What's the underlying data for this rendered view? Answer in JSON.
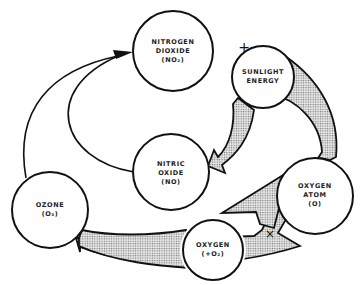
{
  "diagram": {
    "nodes": {
      "no2": {
        "lines": [
          "NITROGEN",
          "DIOXIDE",
          "(NO₂)"
        ]
      },
      "sunlight": {
        "lines": [
          "SUNLIGHT",
          "ENERGY"
        ]
      },
      "no": {
        "lines": [
          "NITRIC",
          "OXIDE",
          "(NO)"
        ]
      },
      "ozone": {
        "lines": [
          "OZONE",
          "(O₃)"
        ]
      },
      "oatom": {
        "lines": [
          "OXYGEN",
          "ATOM",
          "(O)"
        ]
      },
      "o2": {
        "lines": [
          "OXYGEN",
          "(+O₂)"
        ]
      }
    },
    "operators": {
      "plus": "+",
      "cross": "×"
    },
    "colors": {
      "stroke": "#111111",
      "fill_pattern": "#888888"
    }
  }
}
